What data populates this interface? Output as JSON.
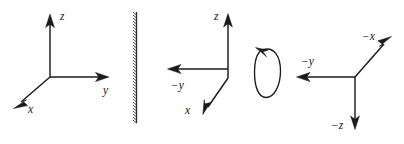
{
  "figure": {
    "ink_color": "#1b1b1b",
    "background_color": "#ffffff",
    "panel_count": 3
  },
  "panels": [
    {
      "id": "original-frame",
      "name": "right-handed-frame",
      "origin": {
        "x": 50,
        "y": 77
      },
      "axes": [
        {
          "name": "z-axis",
          "label": "z",
          "direction": "up",
          "tip": {
            "x": 50,
            "y": 16
          },
          "label_pos": {
            "x": 60,
            "y": 16
          }
        },
        {
          "name": "y-axis",
          "label": "y",
          "direction": "right",
          "tip": {
            "x": 108,
            "y": 77
          },
          "label_pos": {
            "x": 107,
            "y": 90
          }
        },
        {
          "name": "x-axis",
          "label": "x",
          "direction": "down-left",
          "tip": {
            "x": 14,
            "y": 108
          },
          "label_pos": {
            "x": 30,
            "y": 110
          }
        }
      ]
    },
    {
      "id": "mirrored-frame",
      "name": "mirror-image-frame",
      "origin": {
        "x": 228,
        "y": 78
      },
      "axes": [
        {
          "name": "z-axis",
          "label": "z",
          "direction": "up",
          "tip": {
            "x": 228,
            "y": 15
          },
          "label_pos": {
            "x": 218,
            "y": 17
          }
        },
        {
          "name": "negative-y-axis",
          "label": "−y",
          "direction": "left",
          "tip": {
            "x": 168,
            "y": 69
          },
          "label_pos": {
            "x": 178,
            "y": 84
          }
        },
        {
          "name": "x-axis",
          "label": "x",
          "direction": "down-left",
          "tip": {
            "x": 203,
            "y": 114
          },
          "label_pos": {
            "x": 188,
            "y": 110
          }
        }
      ]
    },
    {
      "id": "rotated-frame",
      "name": "rotated-left-handed-frame",
      "origin": {
        "x": 355,
        "y": 77
      },
      "axes": [
        {
          "name": "negative-x-axis",
          "label": "−x",
          "direction": "up-right",
          "tip": {
            "x": 391,
            "y": 37
          },
          "label_pos": {
            "x": 369,
            "y": 36
          }
        },
        {
          "name": "negative-y-axis",
          "label": "−y",
          "direction": "left",
          "tip": {
            "x": 297,
            "y": 77
          },
          "label_pos": {
            "x": 308,
            "y": 61
          }
        },
        {
          "name": "negative-z-axis",
          "label": "−z",
          "direction": "down",
          "tip": {
            "x": 355,
            "y": 129
          },
          "label_pos": {
            "x": 339,
            "y": 126
          }
        }
      ]
    }
  ],
  "mirror": {
    "name": "mirror-plane",
    "label": "",
    "top": {
      "x": 136,
      "y": 12
    },
    "bottom": {
      "x": 136,
      "y": 123
    },
    "hatch_side": "left",
    "hatch_count": 37
  },
  "rotation": {
    "name": "rotation-arrow",
    "label": "",
    "center": {
      "x": 267,
      "y": 72
    },
    "radius_x": 12,
    "radius_y": 26,
    "direction": "counterclockwise",
    "arrow_at": "top-left"
  }
}
